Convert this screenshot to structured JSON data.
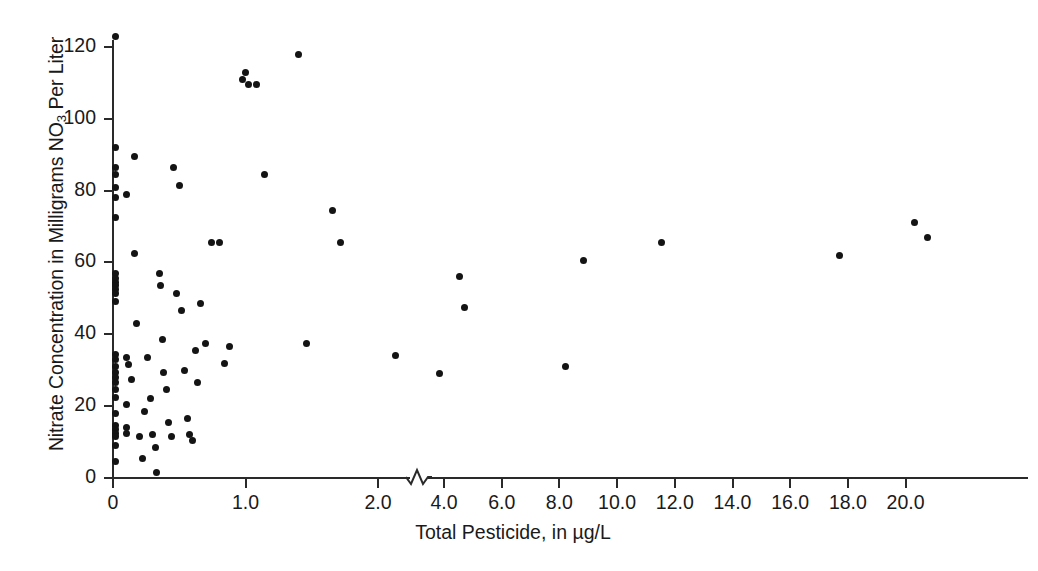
{
  "chart_data": {
    "type": "scatter",
    "title": "",
    "xlabel": "Total Pesticide, in µg/L",
    "ylabel": "Nitrate Concentration in Milligrams NO3 Per Liter",
    "ylabel_parts": {
      "before": "Nitrate Concentration in Milligrams NO",
      "sub": "3",
      "after": " Per Liter"
    },
    "xlim": [
      0,
      21.0
    ],
    "ylim": [
      0,
      128
    ],
    "grid": false,
    "legend": null,
    "axis_break": {
      "present": true,
      "between": [
        2.0,
        4.0
      ],
      "style": "zigzag"
    },
    "xticks": [
      0,
      1.0,
      2.0,
      4.0,
      6.0,
      8.0,
      10.0,
      12.0,
      14.0,
      16.0,
      18.0,
      20.0
    ],
    "xtick_labels": [
      "0",
      "1.0",
      "2.0",
      "4.0",
      "6.0",
      "8.0",
      "10.0",
      "12.0",
      "14.0",
      "16.0",
      "18.0",
      "20.0"
    ],
    "yticks": [
      0,
      20,
      40,
      60,
      80,
      100,
      120
    ],
    "ytick_labels": [
      "0",
      "20",
      "40",
      "60",
      "80",
      "100",
      "120"
    ],
    "marker": {
      "shape": "circle",
      "color": "#141414",
      "size": 7
    },
    "point_count": 96,
    "points": [
      [
        0.02,
        123.0
      ],
      [
        0.02,
        92.0
      ],
      [
        0.02,
        86.5
      ],
      [
        0.02,
        84.5
      ],
      [
        0.02,
        81.0
      ],
      [
        0.02,
        78.0
      ],
      [
        0.02,
        72.5
      ],
      [
        0.02,
        57.0
      ],
      [
        0.02,
        55.5
      ],
      [
        0.02,
        54.5
      ],
      [
        0.02,
        53.5
      ],
      [
        0.02,
        52.5
      ],
      [
        0.02,
        51.5
      ],
      [
        0.02,
        49.0
      ],
      [
        0.02,
        34.5
      ],
      [
        0.02,
        33.0
      ],
      [
        0.02,
        31.0
      ],
      [
        0.02,
        29.5
      ],
      [
        0.02,
        28.0
      ],
      [
        0.02,
        26.5
      ],
      [
        0.02,
        24.5
      ],
      [
        0.02,
        22.5
      ],
      [
        0.02,
        18.0
      ],
      [
        0.02,
        14.5
      ],
      [
        0.02,
        13.5
      ],
      [
        0.02,
        12.5
      ],
      [
        0.02,
        11.5
      ],
      [
        0.02,
        9.0
      ],
      [
        0.02,
        4.5
      ],
      [
        0.1,
        79.0
      ],
      [
        0.1,
        33.5
      ],
      [
        0.1,
        20.5
      ],
      [
        0.1,
        14.0
      ],
      [
        0.1,
        12.5
      ],
      [
        0.12,
        31.5
      ],
      [
        0.14,
        27.5
      ],
      [
        0.16,
        89.5
      ],
      [
        0.16,
        62.5
      ],
      [
        0.18,
        43.0
      ],
      [
        0.2,
        11.5
      ],
      [
        0.22,
        5.5
      ],
      [
        0.24,
        18.5
      ],
      [
        0.26,
        33.5
      ],
      [
        0.28,
        22.0
      ],
      [
        0.3,
        12.0
      ],
      [
        0.32,
        8.5
      ],
      [
        0.33,
        1.5
      ],
      [
        0.35,
        57.0
      ],
      [
        0.36,
        53.5
      ],
      [
        0.37,
        38.5
      ],
      [
        0.38,
        29.5
      ],
      [
        0.4,
        24.5
      ],
      [
        0.42,
        15.5
      ],
      [
        0.44,
        11.5
      ],
      [
        0.46,
        86.5
      ],
      [
        0.48,
        51.5
      ],
      [
        0.5,
        81.5
      ],
      [
        0.52,
        46.5
      ],
      [
        0.54,
        30.0
      ],
      [
        0.56,
        16.5
      ],
      [
        0.58,
        12.0
      ],
      [
        0.6,
        10.5
      ],
      [
        0.62,
        35.5
      ],
      [
        0.64,
        26.5
      ],
      [
        0.66,
        48.5
      ],
      [
        0.7,
        37.5
      ],
      [
        0.74,
        65.5
      ],
      [
        0.8,
        65.5
      ],
      [
        0.84,
        32.0
      ],
      [
        0.88,
        36.5
      ],
      [
        0.98,
        111.0
      ],
      [
        1.0,
        113.0
      ],
      [
        1.02,
        109.5
      ],
      [
        1.08,
        109.5
      ],
      [
        1.14,
        84.5
      ],
      [
        1.4,
        118.0
      ],
      [
        1.46,
        37.5
      ],
      [
        1.66,
        74.5
      ],
      [
        1.72,
        65.5
      ],
      [
        2.32,
        34.0
      ],
      [
        3.85,
        29.0
      ],
      [
        4.52,
        56.0
      ],
      [
        4.7,
        47.5
      ],
      [
        8.2,
        31.0
      ],
      [
        8.85,
        60.5
      ],
      [
        11.55,
        65.5
      ],
      [
        17.7,
        62.0
      ],
      [
        20.3,
        71.0
      ],
      [
        20.75,
        67.0
      ]
    ]
  },
  "axes": {
    "y_title": "Nitrate Concentration in Milligrams NO3 Per Liter",
    "x_title": "Total Pesticide, in µg/L"
  }
}
